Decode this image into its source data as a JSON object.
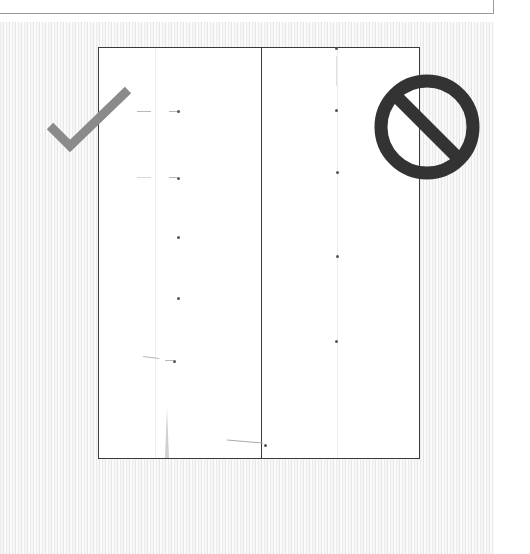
{
  "colors": {
    "check": "#8a8a8a",
    "prohibited": "#333333",
    "frame": "#3a3a3a",
    "dot": "#555555"
  },
  "icons": {
    "left": "check-mark-icon",
    "right": "prohibited-icon"
  },
  "panels": [
    {
      "name": "correct-example",
      "verdict": "correct",
      "dots_y": [
        111,
        177,
        237,
        298,
        362
      ]
    },
    {
      "name": "incorrect-example",
      "verdict": "incorrect",
      "dots_y": [
        48,
        110,
        172,
        256,
        341
      ]
    }
  ],
  "bottom_dot": {
    "x": 265,
    "y": 445
  }
}
